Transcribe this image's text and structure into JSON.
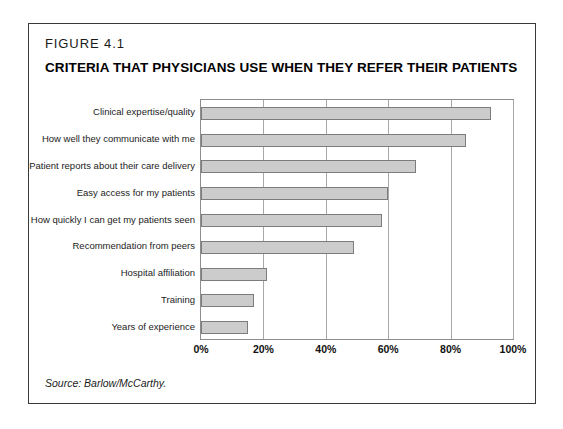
{
  "figure": {
    "number": "FIGURE 4.1",
    "title": "CRITERIA THAT PHYSICIANS USE WHEN THEY REFER THEIR PATIENTS",
    "source": "Source: Barlow/McCarthy."
  },
  "colors": {
    "bar_fill": "#cccccc",
    "bar_border": "#7c7c7c",
    "frame_border": "#3a3a3a",
    "gridline": "#a8a8a8",
    "background": "#ffffff",
    "text": "#1a1a1a"
  },
  "chart_data": {
    "type": "bar",
    "orientation": "horizontal",
    "title": "CRITERIA THAT PHYSICIANS USE WHEN THEY REFER THEIR PATIENTS",
    "xlabel": "",
    "ylabel": "",
    "xlim": [
      0,
      100
    ],
    "grid": true,
    "legend": false,
    "units": "%",
    "tick_labels": [
      "0%",
      "20%",
      "40%",
      "60%",
      "80%",
      "100%"
    ],
    "tick_values": [
      0,
      20,
      40,
      60,
      80,
      100
    ],
    "categories": [
      "Clinical expertise/quality",
      "How well they communicate with me",
      "Patient reports about their care delivery",
      "Easy access for my patients",
      "How quickly I can get my patients seen",
      "Recommendation from peers",
      "Hospital affiliation",
      "Training",
      "Years of experience"
    ],
    "values": [
      93,
      85,
      69,
      60,
      58,
      49,
      21,
      17,
      15
    ]
  }
}
